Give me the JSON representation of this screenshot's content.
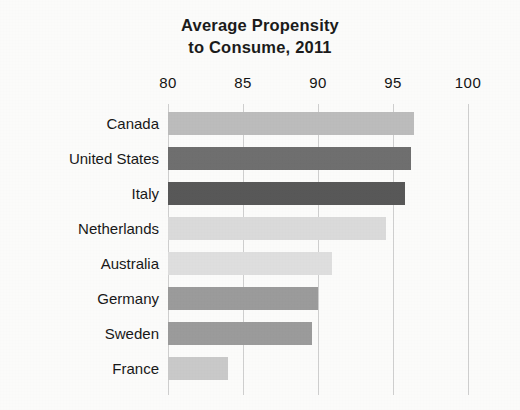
{
  "chart_data": {
    "type": "bar",
    "orientation": "horizontal",
    "title": "Average Propensity to Consume, 2011",
    "title_line1": "Average Propensity",
    "title_line2": "to Consume, 2011",
    "xlabel": "",
    "ylabel": "",
    "xlim": [
      80,
      100
    ],
    "xticks": [
      80,
      85,
      90,
      95,
      100
    ],
    "xtick_labels": [
      "80",
      "85",
      "90",
      "95",
      "100"
    ],
    "grid": "vertical-only",
    "legend": "none",
    "categories": [
      "Canada",
      "United States",
      "Italy",
      "Netherlands",
      "Australia",
      "Germany",
      "Sweden",
      "France"
    ],
    "values": [
      96.4,
      96.2,
      95.8,
      94.5,
      90.9,
      90.0,
      89.6,
      84.0
    ],
    "bar_colors": [
      "#bcbcbc",
      "#6f6f6f",
      "#585858",
      "#dadada",
      "#dedede",
      "#9b9b9b",
      "#9b9b9b",
      "#c9c9c9"
    ],
    "bars": [
      {
        "label": "Canada",
        "value": 96.4,
        "color": "#bcbcbc"
      },
      {
        "label": "United States",
        "value": 96.2,
        "color": "#6f6f6f"
      },
      {
        "label": "Italy",
        "value": 95.8,
        "color": "#585858"
      },
      {
        "label": "Netherlands",
        "value": 94.5,
        "color": "#dadada"
      },
      {
        "label": "Australia",
        "value": 90.9,
        "color": "#dedede"
      },
      {
        "label": "Germany",
        "value": 90.0,
        "color": "#9b9b9b"
      },
      {
        "label": "Sweden",
        "value": 89.6,
        "color": "#9b9b9b"
      },
      {
        "label": "France",
        "value": 84.0,
        "color": "#c9c9c9"
      }
    ],
    "background_color": "#fbfbfa",
    "gridline_color": "#cfcfcf",
    "text_color": "#181818"
  }
}
